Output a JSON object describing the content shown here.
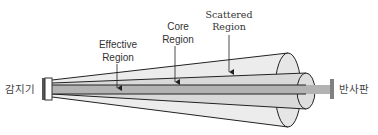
{
  "diagram": {
    "title": "",
    "labels": {
      "detector": "감지기",
      "reflector": "반사판",
      "effective_region": [
        "Effective",
        "Region"
      ],
      "core_region": [
        "Core",
        "Region"
      ],
      "scattered_region": [
        "Scattered",
        "Region"
      ]
    },
    "colors": {
      "outline": "#222222",
      "scattered_fill": "#ececec",
      "effective_fill": "#d9d9d9",
      "core_fill": "#b3b3b3",
      "detector_edge": "#555555",
      "reflector": "#808080",
      "label_text": "#333333"
    },
    "components": [
      {
        "id": "detector",
        "name": "감지기"
      },
      {
        "id": "scattered-region",
        "name": "Scattered Region"
      },
      {
        "id": "effective-region",
        "name": "Effective Region"
      },
      {
        "id": "core-region",
        "name": "Core Region"
      },
      {
        "id": "reflector",
        "name": "반사판"
      }
    ]
  }
}
